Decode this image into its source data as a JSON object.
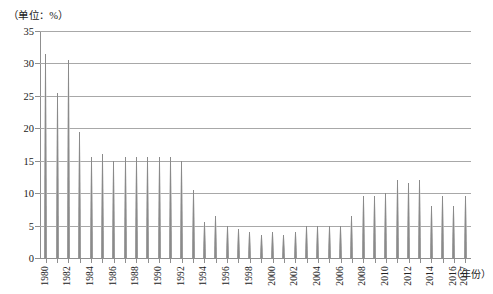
{
  "chart_data": {
    "type": "bar",
    "title": "",
    "subtitle": "",
    "unit_label": "（单位：%）",
    "xlabel": "（年份）",
    "ylabel": "",
    "grid": true,
    "legend": false,
    "legend_position": "none",
    "xlim": [
      1980,
      2017
    ],
    "ylim": [
      0,
      35
    ],
    "ytick_values": [
      0,
      5,
      10,
      15,
      20,
      25,
      30,
      35
    ],
    "ytick_labels": [
      "0",
      "5",
      "10",
      "15",
      "20",
      "25",
      "30",
      "35"
    ],
    "xtick_labels": [
      "1980",
      "1982",
      "1984",
      "1986",
      "1988",
      "1990",
      "1992",
      "1994",
      "1996",
      "1998",
      "2000",
      "2002",
      "2004",
      "2006",
      "2008",
      "2010",
      "2012",
      "2014",
      "2016",
      "2017"
    ],
    "bar_color": "#a0a0a0",
    "grid_color": "#a8a8a8",
    "axis_color": "#8f8f8f",
    "categories": [
      "1980",
      "1981",
      "1982",
      "1983",
      "1984",
      "1985",
      "1986",
      "1987",
      "1988",
      "1989",
      "1990",
      "1991",
      "1992",
      "1993",
      "1994",
      "1995",
      "1996",
      "1997",
      "1998",
      "1999",
      "2000",
      "2001",
      "2002",
      "2003",
      "2004",
      "2005",
      "2006",
      "2007",
      "2008",
      "2009",
      "2010",
      "2011",
      "2012",
      "2013",
      "2014",
      "2015",
      "2016",
      "2017"
    ],
    "values": [
      31.5,
      25.5,
      30.5,
      19.5,
      15.5,
      16.0,
      15.0,
      15.5,
      15.5,
      15.5,
      15.5,
      15.5,
      15.0,
      10.5,
      5.5,
      6.5,
      5.0,
      4.5,
      4.0,
      3.5,
      4.0,
      3.5,
      4.0,
      5.0,
      5.0,
      5.0,
      5.0,
      6.5,
      9.5,
      9.5,
      10.0,
      12.0,
      11.5,
      12.0,
      8.0,
      9.5,
      8.0,
      9.5
    ]
  }
}
